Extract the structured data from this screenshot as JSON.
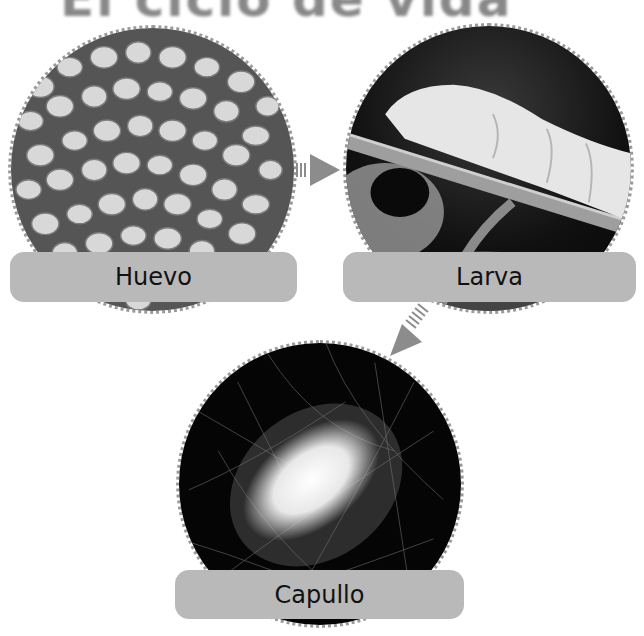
{
  "title": "El ciclo de vida",
  "colors": {
    "label_bar": "#b9b9b9",
    "arrow": "#8c8c8c",
    "dotted_border": "#9a9a9a",
    "label_text": "#111111"
  },
  "stages": [
    {
      "id": "egg",
      "label": "Huevo",
      "image": "silkworm-eggs-photo"
    },
    {
      "id": "larva",
      "label": "Larva",
      "image": "silkworm-larva-on-branch-photo"
    },
    {
      "id": "cocoon",
      "label": "Capullo",
      "image": "silk-cocoon-photo"
    }
  ],
  "arrows": [
    {
      "from": "Huevo",
      "to": "Larva",
      "direction": "right"
    },
    {
      "from": "Larva",
      "to": "Capullo",
      "direction": "down-left"
    }
  ]
}
